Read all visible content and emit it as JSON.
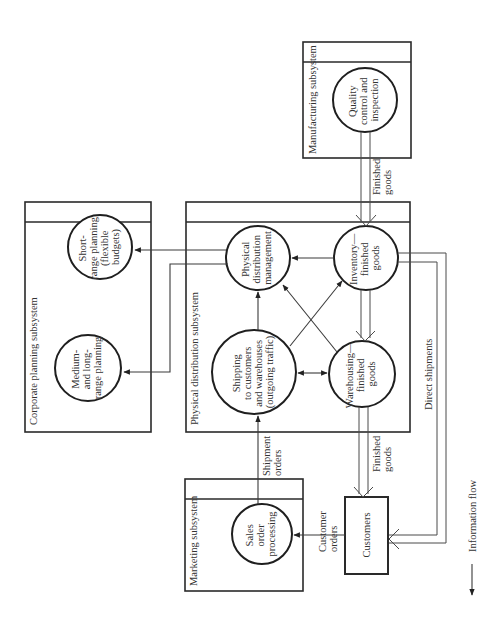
{
  "subsystems": {
    "corporate": {
      "title": "Corporate planning subsystem"
    },
    "physical": {
      "title": "Physical distribution subsystem"
    },
    "manufacturing": {
      "title": "Manufacturing subsystem"
    },
    "marketing": {
      "title": "Marketing subsystem"
    }
  },
  "processes": {
    "short_range": {
      "lines": [
        "Short-",
        "range planning",
        "(flexible",
        "budgets)"
      ]
    },
    "medium_long": {
      "lines": [
        "Medium-",
        "and long-",
        "range planning"
      ]
    },
    "pdm": {
      "lines": [
        "Physical",
        "distribution",
        "management"
      ]
    },
    "inventory": {
      "lines": [
        "Inventory—",
        "finished",
        "goods"
      ]
    },
    "shipping": {
      "lines": [
        "Shipping",
        "to customers",
        "and warehouses",
        "(outgoing traffic)"
      ]
    },
    "warehousing": {
      "lines": [
        "Warehousing—",
        "finished",
        "goods"
      ]
    },
    "quality": {
      "lines": [
        "Quality",
        "control and",
        "inspection"
      ]
    },
    "sales": {
      "lines": [
        "Sales",
        "order",
        "processing"
      ]
    }
  },
  "entities": {
    "customers": {
      "label": "Customers"
    }
  },
  "flows": {
    "finished_goods_top": {
      "lines": [
        "Finished",
        "goods"
      ]
    },
    "finished_goods_bottom": {
      "lines": [
        "Finished",
        "goods"
      ]
    },
    "shipment_orders": {
      "lines": [
        "Shipment",
        "orders"
      ]
    },
    "customer_orders": {
      "lines": [
        "Customer",
        "orders"
      ]
    },
    "direct_shipments": {
      "label": "Direct shipments"
    }
  },
  "legend": {
    "information_flow": "Information flow"
  }
}
